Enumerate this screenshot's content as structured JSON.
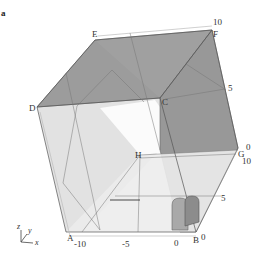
{
  "figure": {
    "panel_label": "a",
    "vertices": {
      "A": "A",
      "B": "B",
      "C": "C",
      "D": "D",
      "E": "E",
      "F": "F",
      "G": "G",
      "H": "H"
    },
    "x_ticks": [
      "-10",
      "-5",
      "0"
    ],
    "y_ticks": [
      "0",
      "5",
      "10"
    ],
    "z_ticks": [
      "0",
      "5",
      "10"
    ],
    "extra_ticks": {
      "b_zero": "0",
      "g_zero": "0",
      "g_ten": "10"
    },
    "axes_glyph": {
      "z": "z",
      "y": "y",
      "x": "x"
    },
    "colors": {
      "face_dark": "#9a9a9a",
      "face_light": "#e4e4e4",
      "face_white": "#f6f6f6",
      "edge": "#555555",
      "label": "#333333"
    }
  }
}
